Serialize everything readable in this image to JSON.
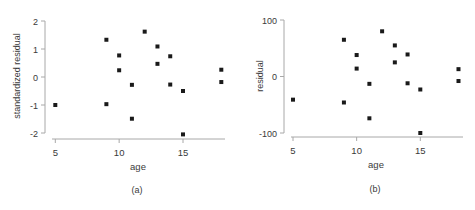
{
  "chart_data": [
    {
      "type": "scatter",
      "panel_label": "(a)",
      "title": "",
      "xlabel": "age",
      "ylabel": "standardized residual",
      "xlim": [
        5,
        18
      ],
      "ylim": [
        -2,
        2
      ],
      "xticks": [
        5,
        10,
        15
      ],
      "yticks": [
        -2,
        -1,
        0,
        1,
        2
      ],
      "grid": false,
      "legend": null,
      "points": [
        {
          "x": 5,
          "y": -1.0
        },
        {
          "x": 9,
          "y": 1.33
        },
        {
          "x": 9,
          "y": -0.97
        },
        {
          "x": 10,
          "y": 0.77
        },
        {
          "x": 10,
          "y": 0.24
        },
        {
          "x": 11,
          "y": -0.28
        },
        {
          "x": 11,
          "y": -1.49
        },
        {
          "x": 12,
          "y": 1.62
        },
        {
          "x": 13,
          "y": 1.09
        },
        {
          "x": 13,
          "y": 0.47
        },
        {
          "x": 14,
          "y": 0.74
        },
        {
          "x": 14,
          "y": -0.27
        },
        {
          "x": 15,
          "y": -0.5
        },
        {
          "x": 15,
          "y": -2.05
        },
        {
          "x": 18,
          "y": 0.26
        },
        {
          "x": 18,
          "y": -0.18
        }
      ]
    },
    {
      "type": "scatter",
      "panel_label": "(b)",
      "title": "",
      "xlabel": "age",
      "ylabel": "residual",
      "xlim": [
        5,
        18
      ],
      "ylim": [
        -100,
        100
      ],
      "xticks": [
        5,
        10,
        15
      ],
      "yticks": [
        -100,
        0,
        100
      ],
      "grid": false,
      "legend": null,
      "points": [
        {
          "x": 5,
          "y": -41
        },
        {
          "x": 9,
          "y": 65
        },
        {
          "x": 9,
          "y": -46
        },
        {
          "x": 10,
          "y": 38
        },
        {
          "x": 10,
          "y": 14
        },
        {
          "x": 11,
          "y": -13
        },
        {
          "x": 11,
          "y": -74
        },
        {
          "x": 12,
          "y": 80
        },
        {
          "x": 13,
          "y": 55
        },
        {
          "x": 13,
          "y": 25
        },
        {
          "x": 14,
          "y": 39
        },
        {
          "x": 14,
          "y": -12
        },
        {
          "x": 15,
          "y": -23
        },
        {
          "x": 15,
          "y": -100
        },
        {
          "x": 18,
          "y": 13
        },
        {
          "x": 18,
          "y": -8
        }
      ]
    }
  ],
  "style": {
    "axis_color": "#a8a8a8",
    "point_color": "#1a1a1a",
    "text_color": "#3a3a3a"
  }
}
